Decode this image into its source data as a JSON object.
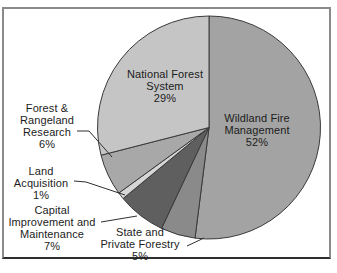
{
  "chart_data": {
    "type": "pie",
    "title": "",
    "legend": "none",
    "labels_on_chart": true,
    "start_angle_deg": 0,
    "direction": "clockwise",
    "background_color": "#ffffff",
    "outline_color": "#3a3a3a",
    "slices": [
      {
        "id": "wildland-fire-management",
        "label": "Wildland Fire Management",
        "value": 52,
        "pct_text": "52%",
        "color": "#a3a3a3",
        "display": "Wildland Fire\nManagement\n52%"
      },
      {
        "id": "state-and-private-forestry",
        "label": "State and Private Forestry",
        "value": 5,
        "pct_text": "5%",
        "color": "#8a8a8a",
        "display": "State and\nPrivate Forestry\n5%"
      },
      {
        "id": "capital-improvement-and-maintenance",
        "label": "Capital Improvement and Maintenance",
        "value": 7,
        "pct_text": "7%",
        "color": "#5f5f5f",
        "display": "Capital\nImprovement and\nMaintenance\n7%"
      },
      {
        "id": "land-acquisition",
        "label": "Land Acquisition",
        "value": 1,
        "pct_text": "1%",
        "color": "#d6d6d6",
        "display": "Land\nAcquisition\n1%"
      },
      {
        "id": "forest-and-rangeland-research",
        "label": "Forest & Rangeland Research",
        "value": 6,
        "pct_text": "6%",
        "color": "#a8a8a8",
        "display": "Forest &\nRangeland\nResearch\n6%"
      },
      {
        "id": "national-forest-system",
        "label": "National Forest System",
        "value": 29,
        "pct_text": "29%",
        "color": "#c5c5c5",
        "display": "National Forest\nSystem\n29%"
      }
    ]
  }
}
